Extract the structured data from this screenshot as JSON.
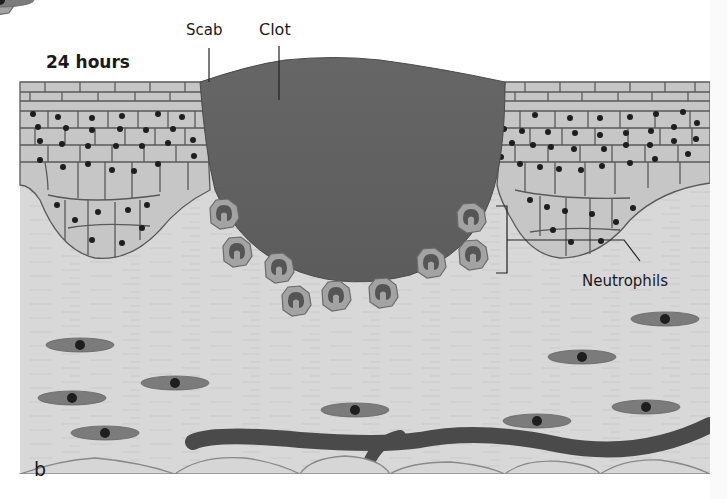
{
  "figure": {
    "panel_letter": "b",
    "time_label": "24 hours",
    "labels": {
      "scab": "Scab",
      "clot": "Clot",
      "neutrophils": "Neutrophils"
    },
    "colors": {
      "background": "#ffffff",
      "dermis": "#d9d9d9",
      "epidermis_cell": "#c4c4c4",
      "cell_border": "#5a5a5a",
      "nucleus": "#1e1e1e",
      "clot": "#5f5f5f",
      "clot_edge": "#4a4a4a",
      "fibroblast": "#7a7a7a",
      "vessel": "#4a4a4a",
      "fat_outline": "#8a8a8a",
      "neutrophil": "#9a9a9a",
      "neutrophil_nucleus": "#555555"
    },
    "structures": [
      "epidermis",
      "clot",
      "scab",
      "neutrophils",
      "fibroblasts",
      "blood-vessel",
      "subcutaneous-fat"
    ],
    "neutrophil_count": 10,
    "fibroblast_count": 11
  }
}
